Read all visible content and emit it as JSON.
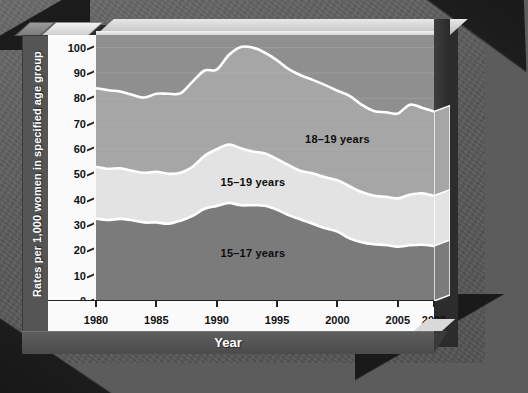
{
  "chart_data": {
    "type": "area",
    "stacked": true,
    "title": "",
    "xlabel": "Year",
    "ylabel": "Rates per 1,000 women in specified age group",
    "xlim": [
      1980,
      2008
    ],
    "ylim": [
      0,
      105
    ],
    "ytick_values": [
      0,
      10,
      20,
      30,
      40,
      50,
      60,
      70,
      80,
      90,
      100
    ],
    "ytick_labels": [
      "0",
      "10",
      "20",
      "30",
      "40",
      "50",
      "60",
      "70",
      "80",
      "90",
      "100"
    ],
    "xtick_values": [
      1980,
      1985,
      1990,
      1995,
      2000,
      2005,
      2008
    ],
    "xtick_labels": [
      "1980",
      "1985",
      "1990",
      "1995",
      "2000",
      "2005",
      "2008"
    ],
    "grid": true,
    "legend_position": "inline-annotations",
    "x": [
      1980,
      1981,
      1982,
      1983,
      1984,
      1985,
      1986,
      1987,
      1988,
      1989,
      1990,
      1991,
      1992,
      1993,
      1994,
      1995,
      1996,
      1997,
      1998,
      1999,
      2000,
      2001,
      2002,
      2003,
      2004,
      2005,
      2006,
      2007,
      2008
    ],
    "series": [
      {
        "name": "15–17 years",
        "band": "bottom",
        "color": "#7b7b7b",
        "values": [
          32.5,
          32.0,
          32.4,
          31.9,
          31.0,
          31.0,
          30.5,
          31.7,
          33.6,
          36.4,
          37.5,
          38.7,
          37.8,
          37.8,
          37.6,
          36.0,
          33.8,
          32.1,
          30.4,
          28.7,
          27.4,
          24.7,
          23.2,
          22.4,
          22.1,
          21.4,
          22.0,
          22.2,
          21.7
        ]
      },
      {
        "name": "15–19 years",
        "band": "middle",
        "color": "#e3e3e3",
        "values": [
          53.0,
          52.2,
          52.4,
          51.4,
          50.6,
          51.0,
          50.2,
          50.6,
          53.0,
          57.3,
          59.9,
          61.8,
          60.3,
          59.0,
          58.2,
          56.0,
          53.5,
          51.3,
          50.3,
          48.8,
          47.7,
          45.3,
          43.0,
          41.6,
          41.1,
          40.5,
          41.9,
          42.5,
          41.5
        ]
      },
      {
        "name": "18–19 years",
        "band": "top",
        "color": "#a6a6a6",
        "values": [
          82.1,
          81.0,
          80.7,
          79.4,
          78.2,
          79.6,
          79.6,
          80.0,
          84.2,
          89.0,
          88.6,
          94.0,
          94.5,
          92.1,
          91.5,
          89.1,
          86.0,
          83.6,
          82.0,
          80.3,
          78.1,
          76.1,
          72.8,
          70.7,
          70.0,
          69.9,
          73.0,
          71.7,
          70.6
        ]
      },
      {
        "name": "total 15–19 outline",
        "band": "outline",
        "color": "#ffffff",
        "values": [
          84.0,
          83.2,
          82.7,
          81.4,
          80.3,
          81.8,
          81.8,
          82.0,
          86.6,
          91.0,
          91.3,
          97.1,
          100.3,
          100.0,
          98.0,
          95.0,
          91.4,
          89.0,
          87.2,
          85.2,
          83.0,
          81.0,
          77.5,
          75.0,
          74.5,
          74.0,
          77.5,
          76.3,
          74.8
        ]
      }
    ],
    "annotations": [
      {
        "text": "18–19 years",
        "x": 2000,
        "y": 64
      },
      {
        "text": "15–19 years",
        "x": 1993,
        "y": 47
      },
      {
        "text": "15–17 years",
        "x": 1993,
        "y": 19
      }
    ]
  },
  "axis": {
    "y_title": "Rates per 1,000 women in specified age group",
    "x_title": "Year"
  },
  "colors": {
    "band_top": "#a6a6a6",
    "band_middle": "#e3e3e3",
    "band_bottom": "#7b7b7b",
    "plot_background": "#8f8f8f",
    "page_background": "#5a5a5a",
    "outline": "#ffffff",
    "axis_text": "#111111"
  }
}
